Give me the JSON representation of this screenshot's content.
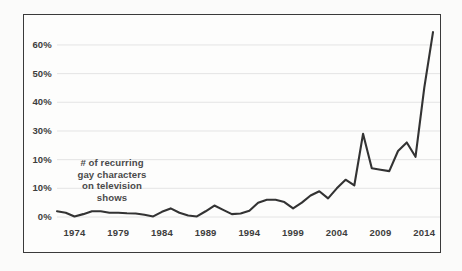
{
  "chart_data": {
    "type": "line",
    "title": "",
    "subtitle": "",
    "annotation": "# of recurring gay characters on television shows",
    "annotation_lines": [
      "# of recurring",
      "gay characters",
      "on television",
      "shows"
    ],
    "xlabel": "",
    "ylabel": "",
    "xlim": [
      1972,
      2015
    ],
    "ylim": [
      0,
      68
    ],
    "grid": true,
    "grid_axis": "y",
    "legend": "none",
    "line_color": "#333333",
    "grid_color": "#e4e4e4",
    "frame_color": "#3a3a3a",
    "background": "#fdfdfc",
    "ytick_labels": [
      "60%",
      "50%",
      "40%",
      "30%",
      "10%",
      "10%",
      "0%"
    ],
    "ytick_values": [
      60,
      50,
      40,
      30,
      20,
      10,
      0
    ],
    "xtick_labels": [
      "1974",
      "1979",
      "1984",
      "1989",
      "1994",
      "1999",
      "2004",
      "2009",
      "2014"
    ],
    "xtick_values": [
      1974,
      1979,
      1984,
      1989,
      1994,
      1999,
      2004,
      2009,
      2014
    ],
    "x": [
      1972,
      1973,
      1974,
      1975,
      1976,
      1977,
      1978,
      1979,
      1980,
      1981,
      1982,
      1983,
      1984,
      1985,
      1986,
      1987,
      1988,
      1989,
      1990,
      1991,
      1992,
      1993,
      1994,
      1995,
      1996,
      1997,
      1998,
      1999,
      2000,
      2001,
      2002,
      2003,
      2004,
      2005,
      2006,
      2007,
      2008,
      2009,
      2010,
      2011,
      2012,
      2013,
      2014,
      2015
    ],
    "values": [
      2.0,
      1.5,
      0.2,
      1.0,
      2.0,
      2.0,
      1.5,
      1.5,
      1.3,
      1.2,
      0.8,
      0.2,
      1.8,
      3.0,
      1.5,
      0.5,
      0.2,
      2.0,
      4.0,
      2.5,
      1.0,
      1.2,
      2.2,
      5.0,
      6.0,
      6.0,
      5.2,
      3.0,
      5.0,
      7.5,
      9.0,
      6.5,
      10.0,
      13.0,
      11.0,
      29.0,
      17.0,
      16.5,
      16.0,
      23.0,
      26.0,
      21.0,
      45.0,
      64.5
    ],
    "series": [
      {
        "name": "# of recurring gay characters on television shows",
        "values": [
          2.0,
          1.5,
          0.2,
          1.0,
          2.0,
          2.0,
          1.5,
          1.5,
          1.3,
          1.2,
          0.8,
          0.2,
          1.8,
          3.0,
          1.5,
          0.5,
          0.2,
          2.0,
          4.0,
          2.5,
          1.0,
          1.2,
          2.2,
          5.0,
          6.0,
          6.0,
          5.2,
          3.0,
          5.0,
          7.5,
          9.0,
          6.5,
          10.0,
          13.0,
          11.0,
          29.0,
          17.0,
          16.5,
          16.0,
          23.0,
          26.0,
          21.0,
          45.0,
          64.5
        ]
      }
    ]
  }
}
